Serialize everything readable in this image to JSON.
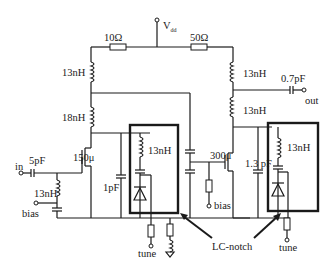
{
  "diagram": {
    "type": "circuit-schematic",
    "title": "",
    "supply": {
      "label": "V",
      "subscript": "dd"
    },
    "resistors": [
      {
        "id": "r_left",
        "label": "10Ω"
      },
      {
        "id": "r_right",
        "label": "50Ω"
      }
    ],
    "inductors": [
      {
        "id": "l_left_top",
        "label": "13nH"
      },
      {
        "id": "l_left_bot",
        "label": "18nH"
      },
      {
        "id": "l_right_top",
        "label": "13nH"
      },
      {
        "id": "l_right_bot",
        "label": "13nH"
      },
      {
        "id": "l_input",
        "label": "13nH"
      },
      {
        "id": "l_notch1",
        "label": "13nH"
      },
      {
        "id": "l_notch2",
        "label": "13nH"
      }
    ],
    "capacitors": [
      {
        "id": "c_in",
        "label": "5pF"
      },
      {
        "id": "c_out",
        "label": "0.7pF"
      },
      {
        "id": "c_stage1",
        "label": "1pF"
      },
      {
        "id": "c_stage2",
        "label": "1.3 pF"
      }
    ],
    "transistors": [
      {
        "id": "m1",
        "label": "150μ"
      },
      {
        "id": "m2",
        "label": "300μ"
      }
    ],
    "ports": {
      "in": "in",
      "out": "out",
      "bias1": "bias",
      "bias2": "bias",
      "tune1": "tune",
      "tune2": "tune"
    },
    "annotation": {
      "label": "LC-notch"
    }
  }
}
